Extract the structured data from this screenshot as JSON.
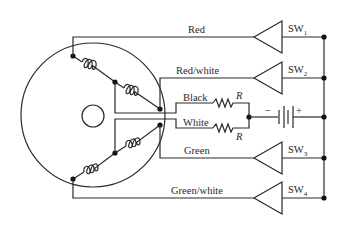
{
  "diagram": {
    "type": "stepper-motor-wiring",
    "wires": [
      {
        "id": "red",
        "label": "Red",
        "switch": "SW",
        "switch_sub": "1"
      },
      {
        "id": "red-white",
        "label": "Red/white",
        "switch": "SW",
        "switch_sub": "2"
      },
      {
        "id": "black",
        "label": "Black",
        "resistor": "R"
      },
      {
        "id": "white",
        "label": "White",
        "resistor": "R"
      },
      {
        "id": "green",
        "label": "Green",
        "switch": "SW",
        "switch_sub": "3"
      },
      {
        "id": "green-white",
        "label": "Green/white",
        "switch": "SW",
        "switch_sub": "4"
      }
    ],
    "battery": {
      "minus": "−",
      "plus": "+"
    },
    "colors": {
      "line": "#2a2a2a",
      "background": "#ffffff"
    }
  }
}
